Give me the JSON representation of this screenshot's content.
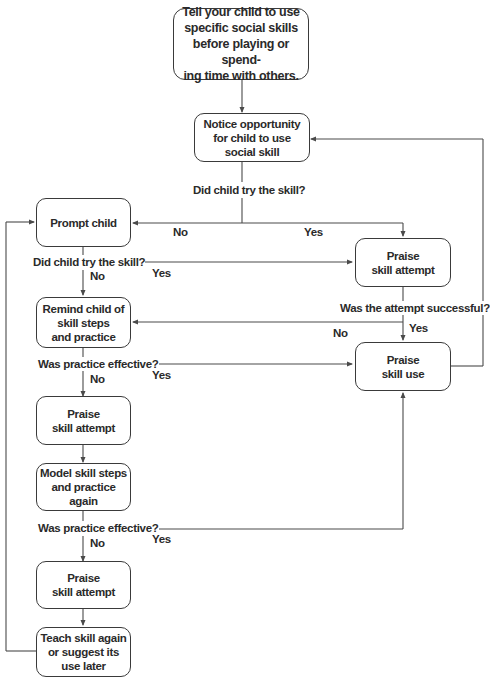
{
  "diagram": {
    "type": "flowchart",
    "nodes": {
      "start": "Tell your child to use\nspecific social skills\nbefore playing or spend-\ning time with others.",
      "notice": "Notice opportunity\nfor child to use\nsocial skill",
      "prompt": "Prompt child",
      "praise_attempt_right": "Praise\nskill attempt",
      "remind": "Remind child of\nskill steps\nand practice",
      "praise_use": "Praise\nskill use",
      "praise_attempt_left_1": "Praise\nskill attempt",
      "model": "Model skill steps\nand practice again",
      "praise_attempt_left_2": "Praise\nskill attempt",
      "teach": "Teach skill again\nor suggest its\nuse later"
    },
    "decisions": {
      "q1": "Did child try the skill?",
      "q2": "Did child try the skill?",
      "q3": "Was the attempt successful?",
      "q4": "Was practice effective?",
      "q5": "Was practice effective?"
    },
    "edge_labels": {
      "q1_no": "No",
      "q1_yes": "Yes",
      "q2_no": "No",
      "q2_yes": "Yes",
      "q3_no": "No",
      "q3_yes": "Yes",
      "q4_no": "No",
      "q4_yes": "Yes",
      "q5_no": "No",
      "q5_yes": "Yes"
    },
    "edges": [
      {
        "from": "start",
        "to": "notice"
      },
      {
        "from": "notice",
        "to": "q1"
      },
      {
        "from": "q1",
        "to": "prompt",
        "label": "No"
      },
      {
        "from": "q1",
        "to": "praise_attempt_right",
        "label": "Yes"
      },
      {
        "from": "prompt",
        "to": "q2"
      },
      {
        "from": "q2",
        "to": "praise_attempt_right",
        "label": "Yes"
      },
      {
        "from": "q2",
        "to": "remind",
        "label": "No"
      },
      {
        "from": "praise_attempt_right",
        "to": "q3"
      },
      {
        "from": "q3",
        "to": "remind",
        "label": "No"
      },
      {
        "from": "q3",
        "to": "praise_use",
        "label": "Yes"
      },
      {
        "from": "remind",
        "to": "q4"
      },
      {
        "from": "q4",
        "to": "praise_use",
        "label": "Yes"
      },
      {
        "from": "q4",
        "to": "praise_attempt_left_1",
        "label": "No"
      },
      {
        "from": "praise_attempt_left_1",
        "to": "model"
      },
      {
        "from": "model",
        "to": "q5"
      },
      {
        "from": "q5",
        "to": "praise_use",
        "label": "Yes"
      },
      {
        "from": "q5",
        "to": "praise_attempt_left_2",
        "label": "No"
      },
      {
        "from": "praise_attempt_left_2",
        "to": "teach"
      },
      {
        "from": "teach",
        "to": "prompt"
      },
      {
        "from": "praise_use",
        "to": "notice"
      }
    ],
    "colors": {
      "line": "#4a4a4a",
      "text": "#2a2a2a",
      "background": "#ffffff"
    }
  }
}
